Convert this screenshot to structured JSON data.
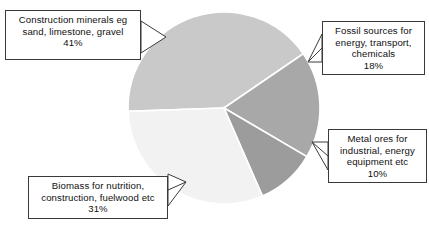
{
  "chart_data": {
    "type": "pie",
    "title": "",
    "unit": "percent",
    "legend_position": "callout-labels",
    "grid": false,
    "total": 100,
    "categories": [
      "Construction minerals eg sand, limestone, gravel",
      "Fossil sources for energy, transport, chemicals",
      "Metal ores for industrial, energy equipment etc",
      "Biomass for nutrition, construction, fuelwood etc"
    ],
    "values": [
      41,
      18,
      10,
      31
    ],
    "slices": [
      {
        "key": "construction-minerals",
        "label": "Construction minerals eg sand, limestone, gravel",
        "value": 41,
        "value_text": "41%",
        "color": "#c9c9c9",
        "start_angle": 178,
        "end_angle": 325.6
      },
      {
        "key": "fossil-sources",
        "label": "Fossil sources for energy, transport, chemicals",
        "value": 18,
        "value_text": "18%",
        "color": "#a8a8a8",
        "start_angle": 325.6,
        "end_angle": 390.4
      },
      {
        "key": "metal-ores",
        "label": "Metal ores for industrial, energy equipment etc",
        "value": 10,
        "value_text": "10%",
        "color": "#9c9c9c",
        "start_angle": 390.4,
        "end_angle": 426.4
      },
      {
        "key": "biomass",
        "label": "Biomass for nutrition, construction, fuelwood etc",
        "value": 31,
        "value_text": "31%",
        "color": "#f2f2f2",
        "start_angle": 426.4,
        "end_angle": 538.0
      }
    ]
  },
  "callouts": {
    "construction": {
      "line1": "Construction minerals eg",
      "line2": "sand, limestone, gravel",
      "line3": "41%"
    },
    "fossil": {
      "line1": "Fossil sources for",
      "line2": "energy, transport,",
      "line3": "chemicals",
      "line4": "18%"
    },
    "metal": {
      "line1": "Metal ores for",
      "line2": "industrial, energy",
      "line3": "equipment etc",
      "line4": "10%"
    },
    "biomass": {
      "line1": "Biomass for nutrition,",
      "line2": "construction, fuelwood etc",
      "line3": "31%"
    }
  },
  "colors": {
    "background": "#ffffff",
    "border": "#3a3a3a",
    "text": "#111111",
    "slice_separator": "#ffffff"
  }
}
